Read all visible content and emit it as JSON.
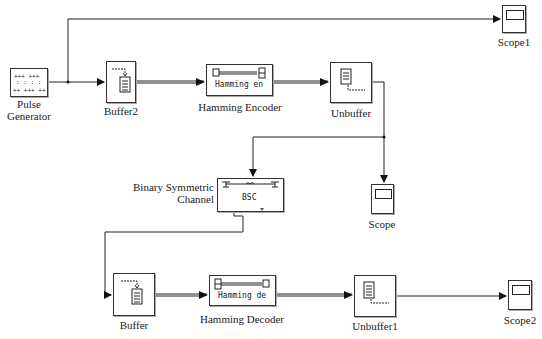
{
  "diagram": {
    "type": "simulink-model",
    "blocks": {
      "pulse_generator": {
        "label_line1": "Pulse",
        "label_line2": "Generator"
      },
      "buffer2": {
        "label": "Buffer2"
      },
      "hamming_encoder": {
        "label": "Hamming Encoder",
        "inner_text": "Hamming en"
      },
      "unbuffer": {
        "label": "Unbuffer"
      },
      "scope1": {
        "label": "Scope1"
      },
      "bsc": {
        "label_line1": "Binary Symmetric",
        "label_line2": "Channel",
        "inner_text": "BSC"
      },
      "scope": {
        "label": "Scope"
      },
      "buffer": {
        "label": "Buffer"
      },
      "hamming_decoder": {
        "label": "Hamming Decoder",
        "inner_text": "Hamming de"
      },
      "unbuffer1": {
        "label": "Unbuffer1"
      },
      "scope2": {
        "label": "Scope2"
      }
    },
    "connections": [
      {
        "from": "Pulse Generator",
        "to": "Buffer2"
      },
      {
        "from": "Pulse Generator",
        "to": "Scope1"
      },
      {
        "from": "Buffer2",
        "to": "Hamming Encoder",
        "kind": "frame"
      },
      {
        "from": "Hamming Encoder",
        "to": "Unbuffer",
        "kind": "frame"
      },
      {
        "from": "Unbuffer",
        "to": "Binary Symmetric Channel"
      },
      {
        "from": "Unbuffer",
        "to": "Scope"
      },
      {
        "from": "Binary Symmetric Channel",
        "to": "Buffer"
      },
      {
        "from": "Buffer",
        "to": "Hamming Decoder",
        "kind": "frame"
      },
      {
        "from": "Hamming Decoder",
        "to": "Unbuffer1",
        "kind": "frame"
      },
      {
        "from": "Unbuffer1",
        "to": "Scope2"
      }
    ],
    "colors": {
      "line": "#222222",
      "block_border": "#333333",
      "background": "#ffffff"
    }
  }
}
